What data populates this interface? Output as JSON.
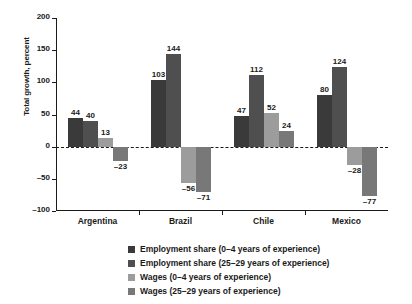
{
  "chart_data": {
    "type": "bar",
    "title": "",
    "xlabel": "",
    "ylabel": "Total growth, percent",
    "ylim": [
      -100,
      200
    ],
    "yticks": [
      200,
      150,
      100,
      50,
      0,
      -50,
      -100
    ],
    "ytick_labels": [
      "200",
      "150",
      "100",
      "50",
      "0",
      "–50",
      "–100"
    ],
    "grid": false,
    "zero_line": true,
    "legend_position": "bottom",
    "categories": [
      "Argentina",
      "Brazil",
      "Chile",
      "Mexico"
    ],
    "series": [
      {
        "name": "Employment share (0–4 years of experience)",
        "color": "#3a3a3a",
        "values": [
          44,
          103,
          47,
          80
        ],
        "labels": [
          "44",
          "103",
          "47",
          "80"
        ]
      },
      {
        "name": "Employment share (25–29 years of experience)",
        "color": "#4f4f4f",
        "values": [
          40,
          144,
          112,
          124
        ],
        "labels": [
          "40",
          "144",
          "112",
          "124"
        ]
      },
      {
        "name": "Wages (0–4 years of experience)",
        "color": "#9c9c9c",
        "values": [
          13,
          -56,
          52,
          -28
        ],
        "labels": [
          "13",
          "–56",
          "52",
          "–28"
        ]
      },
      {
        "name": "Wages (25–29 years of experience)",
        "color": "#787878",
        "values": [
          -23,
          -71,
          24,
          -77
        ],
        "labels": [
          "–23",
          "–71",
          "24",
          "–77"
        ]
      }
    ]
  }
}
